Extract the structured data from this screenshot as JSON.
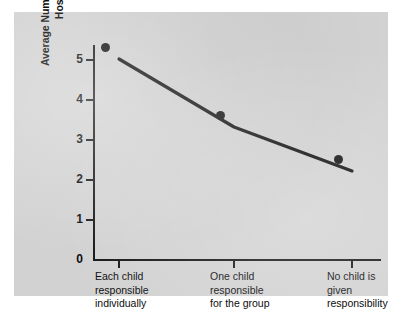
{
  "figure": {
    "panel_bg": "#d2d2d2",
    "page_bg": "#ffffff",
    "line_color": "#111111",
    "axis_color": "#171717",
    "text_color": "#0d0d0d"
  },
  "chart_data": {
    "type": "line",
    "title": "",
    "xlabel": "",
    "ylabel_lines": [
      "Average Number of Candies Donated for",
      "Hospitalized Children"
    ],
    "ylabel": "Average Number of Candies Donated for Hospitalized Children",
    "categories": [
      "Each child responsible individually",
      "One child responsible for the group",
      "No child is given responsibility"
    ],
    "category_lines": [
      [
        "Each child",
        "responsible",
        "individually"
      ],
      [
        "One child",
        "responsible",
        "for the group"
      ],
      [
        "No child is",
        "given",
        "responsibility"
      ]
    ],
    "values": [
      5.0,
      3.3,
      2.2
    ],
    "yticks": [
      0,
      1,
      2,
      3,
      4,
      5
    ],
    "ytick_labels": [
      "0",
      "1",
      "2",
      "3",
      "4",
      "5"
    ],
    "ylim": [
      0,
      5.4
    ],
    "grid": false,
    "legend": null,
    "markers": "filled-circle"
  }
}
